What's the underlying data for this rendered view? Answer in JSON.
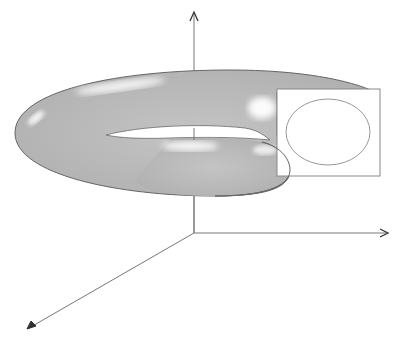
{
  "figure": {
    "colors": {
      "background": "#ffffff",
      "axis": "#777777",
      "arrowhead": "#333333",
      "torus_fill": "#bcbcbc",
      "torus_outline": "#666666",
      "highlight": "#ffffff",
      "section_box": "#888888",
      "section_ellipse": "#999999"
    },
    "axes": {
      "origin": [
        194,
        233
      ],
      "z_axis_top": [
        194,
        12
      ],
      "x_axis_right": [
        387,
        233
      ],
      "y_axis_bottom_left": [
        27,
        329
      ]
    },
    "section_box": {
      "x": 277,
      "y": 89,
      "width": 103,
      "height": 87
    },
    "section_ellipse": {
      "cx": 328,
      "cy": 132,
      "rx": 42,
      "ry": 33
    }
  },
  "caption": {
    "text": "",
    "note": "caption truncated at bottom edge; not legible"
  }
}
